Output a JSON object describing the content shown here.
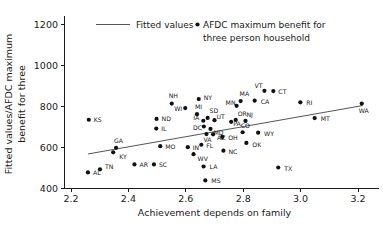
{
  "chart_data": {
    "type": "scatter",
    "title": "",
    "xlabel": "Achievement depends on family",
    "ylabel_line1": "Fitted values/AFDC maximum",
    "ylabel_line2": "benefit for three",
    "xlim": [
      2.2,
      3.2
    ],
    "ylim": [
      400,
      1200
    ],
    "xticks": [
      "2.2",
      "2.4",
      "2.6",
      "2.8",
      "3.0",
      "3.2"
    ],
    "xtick_values": [
      2.2,
      2.4,
      2.6,
      2.8,
      3.0,
      3.2
    ],
    "yticks": [
      "400",
      "600",
      "800",
      "1000",
      "1200"
    ],
    "ytick_values": [
      400,
      600,
      800,
      1000,
      1200
    ],
    "grid": false,
    "legend_position": "top-center",
    "legend": [
      {
        "marker": "line",
        "label": "Fitted values"
      },
      {
        "marker": "dot",
        "label": "AFDC maximum benefit for"
      },
      {
        "marker": "none",
        "label": "three person household"
      }
    ],
    "series": [
      {
        "name": "AFDC maximum benefit for three person household",
        "marker": "dot",
        "color": "#111111",
        "points": [
          {
            "label": "KS",
            "x": 2.262,
            "y": 733,
            "lx": 5,
            "ly": 2.5
          },
          {
            "label": "AL",
            "x": 2.259,
            "y": 476,
            "lx": 5,
            "ly": 2.5
          },
          {
            "label": "TN",
            "x": 2.301,
            "y": 491,
            "lx": 5,
            "ly": 0
          },
          {
            "label": "GA",
            "x": 2.357,
            "y": 596,
            "lx": -2,
            "ly": -5
          },
          {
            "label": "KY",
            "x": 2.347,
            "y": 574,
            "lx": 6,
            "ly": 7
          },
          {
            "label": "AR",
            "x": 2.421,
            "y": 515,
            "lx": 5,
            "ly": 2.5
          },
          {
            "label": "SC",
            "x": 2.489,
            "y": 515,
            "lx": 5,
            "ly": 2.5
          },
          {
            "label": "ND",
            "x": 2.498,
            "y": 737,
            "lx": 5,
            "ly": 2.5
          },
          {
            "label": "IL",
            "x": 2.497,
            "y": 690,
            "lx": 5,
            "ly": 2.5
          },
          {
            "label": "MO",
            "x": 2.511,
            "y": 604,
            "lx": 5,
            "ly": 2.5
          },
          {
            "label": "NH",
            "x": 2.551,
            "y": 812,
            "lx": -3,
            "ly": -6
          },
          {
            "label": "WI",
            "x": 2.598,
            "y": 790,
            "lx": -11,
            "ly": 2.5
          },
          {
            "label": "IN",
            "x": 2.607,
            "y": 599,
            "lx": 5,
            "ly": 2.5
          },
          {
            "label": "WV",
            "x": 2.627,
            "y": 565,
            "lx": 4,
            "ly": 7
          },
          {
            "label": "MI",
            "x": 2.639,
            "y": 760,
            "lx": -2,
            "ly": -5
          },
          {
            "label": "NY",
            "x": 2.645,
            "y": 834,
            "lx": 5,
            "ly": 1
          },
          {
            "label": "FL",
            "x": 2.654,
            "y": 611,
            "lx": 5,
            "ly": 3
          },
          {
            "label": "IA",
            "x": 2.661,
            "y": 728,
            "lx": -10,
            "ly": -1
          },
          {
            "label": "LA",
            "x": 2.662,
            "y": 505,
            "lx": 6,
            "ly": 3
          },
          {
            "label": "DC",
            "x": 2.663,
            "y": 700,
            "lx": -11,
            "ly": 3.5
          },
          {
            "label": "MS",
            "x": 2.668,
            "y": 437,
            "lx": 6,
            "ly": 3
          },
          {
            "label": "SD",
            "x": 2.676,
            "y": 742,
            "lx": 2,
            "ly": -5
          },
          {
            "label": "VA",
            "x": 2.672,
            "y": 663,
            "lx": -3,
            "ly": 8
          },
          {
            "label": "MD",
            "x": 2.686,
            "y": 688,
            "lx": 3,
            "ly": 6.5
          },
          {
            "label": "AZ",
            "x": 2.695,
            "y": 662,
            "lx": 4,
            "ly": 6
          },
          {
            "label": "UT",
            "x": 2.7,
            "y": 731,
            "lx": 2,
            "ly": -1
          },
          {
            "label": "NC",
            "x": 2.731,
            "y": 582,
            "lx": 5,
            "ly": 3
          },
          {
            "label": "OH",
            "x": 2.727,
            "y": 649,
            "lx": 6,
            "ly": 3
          },
          {
            "label": "PA",
            "x": 2.758,
            "y": 723,
            "lx": 2,
            "ly": 4.5
          },
          {
            "label": "MN",
            "x": 2.777,
            "y": 801,
            "lx": -11,
            "ly": -1
          },
          {
            "label": "MA",
            "x": 2.791,
            "y": 824,
            "lx": -1,
            "ly": -5
          },
          {
            "label": "OR",
            "x": 2.774,
            "y": 732,
            "lx": 2,
            "ly": -3.5
          },
          {
            "label": "NJ",
            "x": 2.808,
            "y": 727,
            "lx": 1,
            "ly": -3.5
          },
          {
            "label": "CO",
            "x": 2.798,
            "y": 672,
            "lx": -2,
            "ly": -4
          },
          {
            "label": "OK",
            "x": 2.811,
            "y": 620,
            "lx": 6,
            "ly": 4
          },
          {
            "label": "CA",
            "x": 2.84,
            "y": 826,
            "lx": 6,
            "ly": 3
          },
          {
            "label": "WY",
            "x": 2.852,
            "y": 670,
            "lx": 6,
            "ly": 3
          },
          {
            "label": "VT",
            "x": 2.874,
            "y": 874,
            "lx": -10,
            "ly": -3
          },
          {
            "label": "CT",
            "x": 2.905,
            "y": 873,
            "lx": 5,
            "ly": 2.5
          },
          {
            "label": "TX",
            "x": 2.922,
            "y": 500,
            "lx": 6,
            "ly": 3
          },
          {
            "label": "RI",
            "x": 2.999,
            "y": 818,
            "lx": 6,
            "ly": 3
          },
          {
            "label": "MT",
            "x": 3.049,
            "y": 741,
            "lx": 6,
            "ly": 3
          },
          {
            "label": "WA",
            "x": 3.213,
            "y": 812,
            "lx": -3,
            "ly": 9
          }
        ]
      }
    ],
    "fitted_line": {
      "name": "Fitted values",
      "color": "#55555a",
      "x1": 2.259,
      "y1": 566,
      "x2": 3.216,
      "y2": 802
    }
  }
}
